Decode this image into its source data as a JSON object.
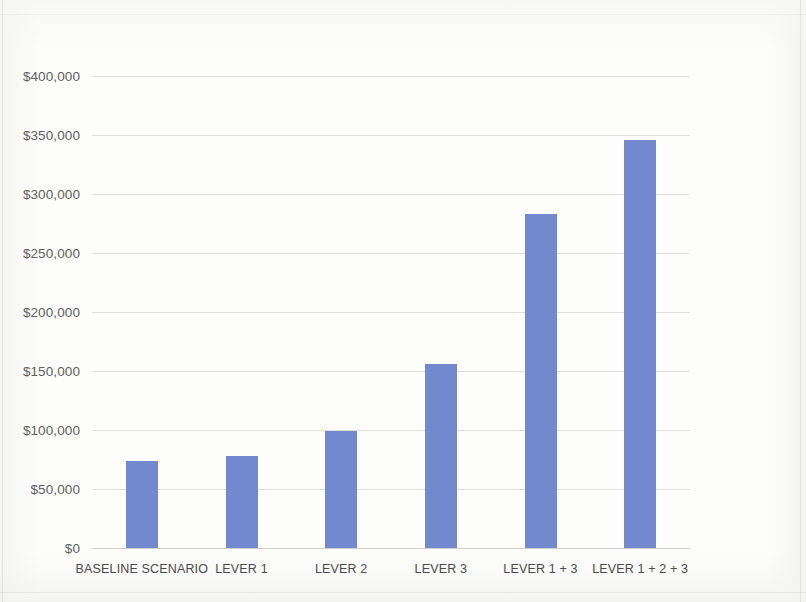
{
  "chart_data": {
    "type": "bar",
    "title": "",
    "subtitle": "",
    "xlabel": "",
    "ylabel": "",
    "categories": [
      "BASELINE SCENARIO",
      "LEVER 1",
      "LEVER 2",
      "LEVER 3",
      "LEVER 1 + 3",
      "LEVER 1 + 2 + 3"
    ],
    "values": [
      74000,
      78000,
      99000,
      156000,
      283000,
      346000
    ],
    "ylim": [
      0,
      400000
    ],
    "ytick_values": [
      0,
      50000,
      100000,
      150000,
      200000,
      250000,
      300000,
      350000,
      400000
    ],
    "ytick_labels": [
      "$0",
      "$50,000",
      "$100,000",
      "$150,000",
      "$200,000",
      "$250,000",
      "$300,000",
      "$350,000",
      "$400,000"
    ],
    "grid": true,
    "legend": false,
    "legend_position": "none",
    "series": [
      {
        "name": "Value",
        "values": [
          74000,
          78000,
          99000,
          156000,
          283000,
          346000
        ],
        "color": "#7289d0"
      }
    ],
    "colors": {
      "bar": "#7289d0",
      "gridline": "#d9d9d6",
      "axis_text": "#5f5f5d",
      "category_text": "#4a4a48",
      "background": "#fdfdfc"
    }
  }
}
